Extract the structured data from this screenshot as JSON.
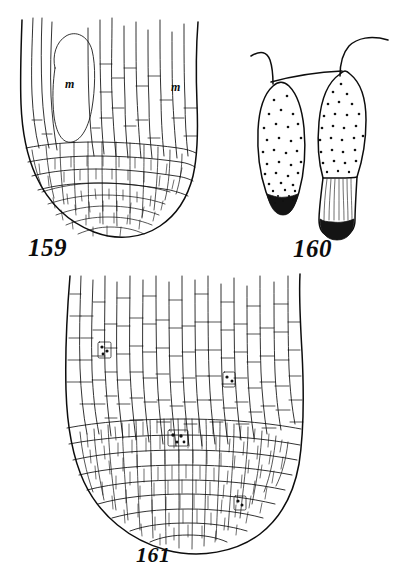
{
  "plate": {
    "kind": "botanical-illustration-plate",
    "background_color": "#ffffff",
    "ink_color": "#0d0d0d",
    "width": 394,
    "height": 581,
    "figure_count": 3
  },
  "figures": [
    {
      "id": "fig-159",
      "caption": "159",
      "subject": "root tip longitudinal section",
      "description": "Dome-shaped root apex with elongated vertical cells above and small isodiametric cells forming the rounded cap below",
      "labels": [
        {
          "text": "m",
          "position": "upper-left, inside large ovate cell"
        },
        {
          "text": "m",
          "position": "upper-right, beside marginal cell file"
        }
      ],
      "label_count": 2
    },
    {
      "id": "fig-160",
      "caption": "160",
      "subject": "pair of elongated stippled cells with hooked stalks",
      "description": "Two club-shaped bodies with granular stippled contents, darkened basal tips; the right one bears a striated neck; both attach to curved hook-like stalks at the top",
      "cells": [
        {
          "name": "left-cell",
          "tip": "dark stippled base",
          "contents": "scattered granules"
        },
        {
          "name": "right-cell",
          "tip": "dark rounded base",
          "contents": "scattered granules",
          "neck": "striated"
        }
      ],
      "labels": []
    },
    {
      "id": "fig-161",
      "caption": "161",
      "subject": "large root tip longitudinal section",
      "description": "Broad rounded apex with dense cellular tissue; elongated vertical cell files at the top grading into small polygonal cells toward the rounded tip; several small cells carry dark nuclear markings",
      "marked_cells": [
        {
          "name": "marked-cell-upper-left",
          "note": "dark nuclear marking"
        },
        {
          "name": "marked-cell-upper-right",
          "note": "dark nuclear marking"
        },
        {
          "name": "marked-cell-center",
          "note": "dark nuclear marking"
        },
        {
          "name": "marked-cell-lower-right",
          "note": "dark nuclear marking"
        }
      ],
      "marked_cell_count": 4,
      "labels": []
    }
  ],
  "captions": {
    "fig159": "159",
    "fig160": "160",
    "fig161": "161"
  },
  "annotations": {
    "m_left": "m",
    "m_right": "m"
  }
}
